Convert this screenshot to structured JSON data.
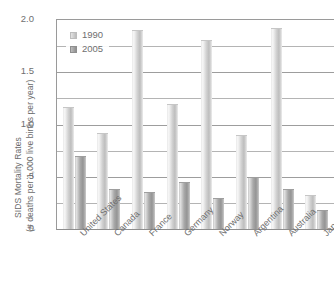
{
  "chart_data": {
    "type": "bar",
    "title": "",
    "xlabel": "",
    "ylabel": "SIDS Mortality Rates (# deaths per 1,000 live births per year)",
    "ylabel_lines": [
      "SIDS Mortality Rates",
      "(# deaths per 1,000 live births per year)"
    ],
    "ylim": [
      0,
      2.0
    ],
    "ytick_labels": [
      "0",
      ".5",
      "1.0",
      "1.5",
      "2.0"
    ],
    "ytick_values": [
      0,
      0.5,
      1.0,
      1.5,
      2.0
    ],
    "minor_gridlines": [
      0.25,
      0.75,
      1.25,
      1.75
    ],
    "grid": true,
    "legend_position": "top-left",
    "categories": [
      "United States",
      "Canada",
      "France",
      "Germany",
      "Norway",
      "Argentina",
      "Australia",
      "Japan"
    ],
    "series": [
      {
        "name": "1990",
        "color": "#d2d2d2",
        "values": [
          1.17,
          0.92,
          1.9,
          1.2,
          1.81,
          0.9,
          1.92,
          0.33
        ]
      },
      {
        "name": "2005",
        "color": "#a0a0a0",
        "values": [
          0.7,
          0.38,
          0.35,
          0.45,
          0.3,
          0.5,
          0.38,
          0.18
        ]
      }
    ]
  }
}
